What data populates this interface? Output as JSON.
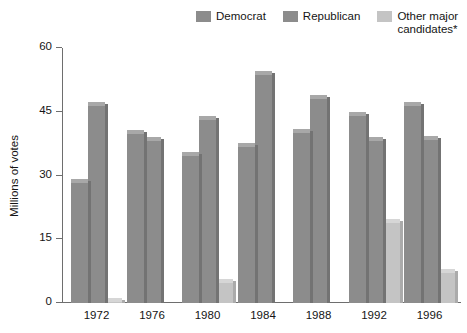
{
  "chart_data": {
    "type": "bar",
    "title": "",
    "xlabel": "",
    "ylabel": "Millions of votes",
    "ylim": [
      0,
      60
    ],
    "yticks": [
      0,
      15,
      30,
      45,
      60
    ],
    "grid": false,
    "legend_position": "top-right",
    "categories": [
      "1972",
      "1976",
      "1980",
      "1984",
      "1988",
      "1992",
      "1996"
    ],
    "series": [
      {
        "name": "Democrat",
        "color": "#8c8c8c",
        "values": [
          29.2,
          40.8,
          35.5,
          37.6,
          41.0,
          44.9,
          47.4
        ]
      },
      {
        "name": "Republican",
        "color": "#8c8c8c",
        "values": [
          47.2,
          39.1,
          43.9,
          54.5,
          48.9,
          39.1,
          39.2
        ]
      },
      {
        "name": "Other major\ncandidates*",
        "color": "#c4c4c4",
        "values": [
          1.1,
          0.0,
          5.7,
          0.0,
          0.0,
          19.7,
          8.1
        ]
      }
    ]
  },
  "legend": {
    "items": [
      {
        "label": "Democrat",
        "swatch_color": "#8c8c8c"
      },
      {
        "label": "Republican",
        "swatch_color": "#8c8c8c"
      },
      {
        "label": "Other major\ncandidates*",
        "swatch_color": "#c4c4c4"
      }
    ]
  },
  "axes": {
    "y_title": "Millions of votes",
    "y_labels": [
      "60",
      "45",
      "30",
      "15",
      "0"
    ],
    "x_labels": [
      "1972",
      "1976",
      "1980",
      "1984",
      "1988",
      "1992",
      "1996"
    ]
  },
  "footnote": "",
  "colors": {
    "bar_main": "#8c8c8c",
    "bar_main_top": "#a8a8a8",
    "bar_main_side": "#737373",
    "bar_other": "#c4c4c4",
    "bar_other_top": "#d6d6d6",
    "bar_other_side": "#ababab",
    "axis": "#6e6e6e",
    "text": "#151515",
    "background": "#ffffff"
  }
}
